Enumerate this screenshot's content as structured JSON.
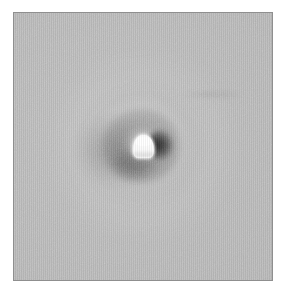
{
  "figure": {
    "title": "",
    "panel_label": "",
    "background_color": "#ffffff"
  },
  "panel": {
    "name": "image-panel",
    "border_color": "#8f8f8f",
    "background_color": "#b6b6b6",
    "left": 13,
    "top": 12,
    "width": 260,
    "height": 269
  },
  "chart_data": {
    "type": "heatmap",
    "title": "",
    "subtitle": "",
    "xlabel": "",
    "ylabel": "",
    "colormap": "grayscale",
    "grid": false,
    "legend": false,
    "colorbar": false,
    "axis_ticks": false,
    "axis_tick_labels": [],
    "xlim": [
      0,
      260
    ],
    "ylim": [
      0,
      269
    ],
    "background_level": 0.62,
    "value_range": [
      0.13,
      1.0
    ],
    "annotations": [],
    "features": [
      {
        "name": "saturated-core",
        "description": "bright white dome-shaped saturated source at field center",
        "center_x": 143,
        "center_y": 149,
        "width": 21,
        "height": 23,
        "peak_value": 1.0,
        "color": "#fbfbfb"
      },
      {
        "name": "dark-annulus",
        "description": "dark negative ring surrounding the bright core",
        "center_x": 143,
        "center_y": 149,
        "outer_radius": 39,
        "min_value": 0.22,
        "color": "#3a3a3a"
      },
      {
        "name": "dark-knot-right",
        "description": "deepest dark patch on the right flank of the core",
        "center_x": 158,
        "center_y": 149,
        "min_value": 0.13,
        "color": "#2a2a2a"
      },
      {
        "name": "dark-wing-left",
        "description": "broad diffuse dark lobe extending left of the core",
        "center_x": 113,
        "center_y": 152,
        "min_value": 0.4,
        "color": "#6e6e6e"
      },
      {
        "name": "dark-knot-below",
        "description": "dark shading below and lower-left of the core",
        "center_x": 128,
        "center_y": 165,
        "min_value": 0.44,
        "color": "#787878"
      },
      {
        "name": "bright-halo",
        "description": "faint light halo ringing the dark annulus",
        "center_x": 143,
        "center_y": 147,
        "outer_radius": 95,
        "peak_value": 0.7,
        "color": "#c6c6c6"
      },
      {
        "name": "faint-streak",
        "description": "faint horizontal dark streak in upper right quadrant",
        "center_x": 199,
        "center_y": 82,
        "length": 62,
        "min_value": 0.58,
        "color": "#a8a8a8"
      }
    ],
    "noise": {
      "present": true,
      "description": "fine pixel-level detector noise across the whole frame",
      "amplitude": 0.02
    }
  }
}
